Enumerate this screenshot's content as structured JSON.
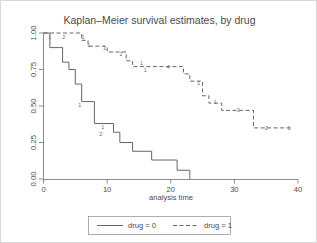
{
  "chart_data": {
    "type": "line",
    "title": "Kaplan–Meier survival estimates, by drug",
    "xlabel": "analysis time",
    "ylabel": "",
    "xlim": [
      0,
      40
    ],
    "ylim": [
      0,
      1
    ],
    "grid": false,
    "legend_position": "bottom",
    "xticks": [
      0,
      10,
      20,
      30,
      40
    ],
    "xtick_labels": [
      "0",
      "10",
      "20",
      "30",
      "40"
    ],
    "yticks": [
      0.0,
      0.25,
      0.5,
      0.75,
      1.0
    ],
    "ytick_labels": [
      "0.00",
      "0.25",
      "0.50",
      "0.75",
      "1.00"
    ],
    "series": [
      {
        "name": "drug = 0",
        "style": "solid",
        "points": [
          [
            0,
            1.0
          ],
          [
            1,
            1.0
          ],
          [
            1,
            0.9
          ],
          [
            3,
            0.9
          ],
          [
            3,
            0.8
          ],
          [
            4,
            0.8
          ],
          [
            4,
            0.75
          ],
          [
            5,
            0.75
          ],
          [
            5,
            0.65
          ],
          [
            6,
            0.65
          ],
          [
            6,
            0.53
          ],
          [
            8,
            0.53
          ],
          [
            8,
            0.38
          ],
          [
            11,
            0.38
          ],
          [
            11,
            0.32
          ],
          [
            12,
            0.32
          ],
          [
            12,
            0.25
          ],
          [
            14,
            0.25
          ],
          [
            14,
            0.19
          ],
          [
            17,
            0.19
          ],
          [
            17,
            0.13
          ],
          [
            21,
            0.13
          ],
          [
            21,
            0.06
          ],
          [
            23,
            0.06
          ],
          [
            23,
            0.0
          ]
        ],
        "censor_labels": [
          {
            "time": 5.7,
            "surv": 0.53,
            "text": "1"
          },
          {
            "time": 9.3,
            "surv": 0.38,
            "text": "1"
          },
          {
            "time": 9.0,
            "surv": 0.33,
            "text": "2"
          }
        ]
      },
      {
        "name": "drug = 1",
        "style": "dashed",
        "points": [
          [
            0,
            1.0
          ],
          [
            6,
            1.0
          ],
          [
            6,
            0.95
          ],
          [
            7,
            0.95
          ],
          [
            7,
            0.91
          ],
          [
            10,
            0.91
          ],
          [
            10,
            0.87
          ],
          [
            13,
            0.87
          ],
          [
            13,
            0.81
          ],
          [
            14,
            0.81
          ],
          [
            14,
            0.77
          ],
          [
            22,
            0.77
          ],
          [
            22,
            0.72
          ],
          [
            23,
            0.72
          ],
          [
            23,
            0.67
          ],
          [
            25,
            0.67
          ],
          [
            25,
            0.57
          ],
          [
            26,
            0.57
          ],
          [
            26,
            0.52
          ],
          [
            28,
            0.52
          ],
          [
            28,
            0.47
          ],
          [
            33,
            0.47
          ],
          [
            33,
            0.35
          ],
          [
            39,
            0.35
          ]
        ],
        "censor_labels": [
          {
            "time": 1.0,
            "surv": 1.0,
            "text": "1"
          },
          {
            "time": 3.2,
            "surv": 1.0,
            "text": "2"
          },
          {
            "time": 6.2,
            "surv": 1.0,
            "text": "1"
          },
          {
            "time": 7.1,
            "surv": 0.94,
            "text": "1"
          },
          {
            "time": 9.6,
            "surv": 0.92,
            "text": "1"
          },
          {
            "time": 12.2,
            "surv": 0.88,
            "text": "2"
          },
          {
            "time": 15.4,
            "surv": 0.82,
            "text": "1"
          },
          {
            "time": 16.0,
            "surv": 0.77,
            "text": "1"
          },
          {
            "time": 19.6,
            "surv": 0.79,
            "text": "4"
          },
          {
            "time": 24.4,
            "surv": 0.68,
            "text": "1"
          },
          {
            "time": 27.0,
            "surv": 0.55,
            "text": "1"
          },
          {
            "time": 30.6,
            "surv": 0.5,
            "text": "3"
          },
          {
            "time": 35.0,
            "surv": 0.37,
            "text": "2"
          },
          {
            "time": 38.6,
            "surv": 0.37,
            "text": "1"
          }
        ]
      }
    ],
    "legend_entries": [
      {
        "label": "drug = 0",
        "style": "solid"
      },
      {
        "label": "drug = 1",
        "style": "dashed"
      }
    ]
  }
}
